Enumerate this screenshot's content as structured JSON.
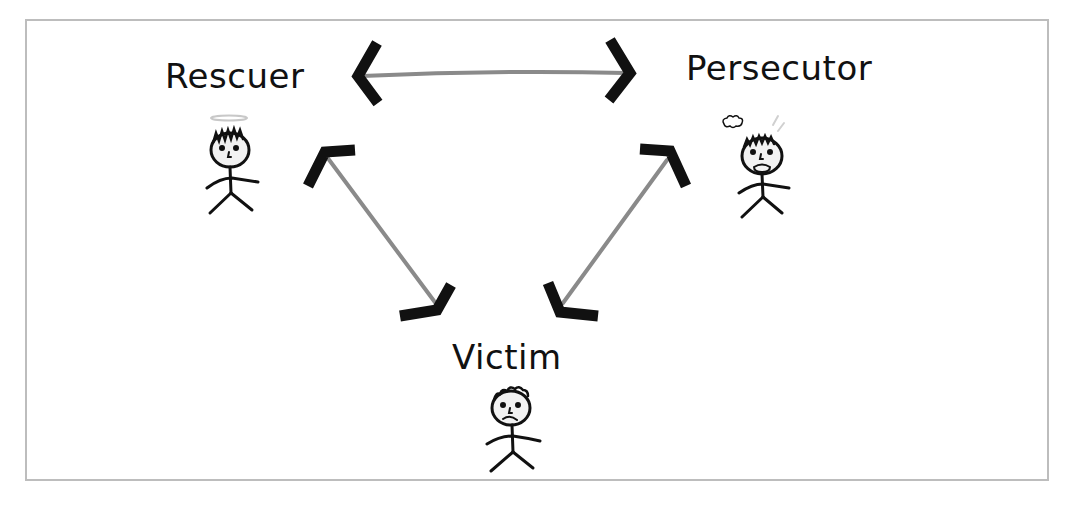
{
  "diagram": {
    "roles": [
      {
        "id": "rescuer",
        "label": "Rescuer",
        "emotion": "calm-halo"
      },
      {
        "id": "persecutor",
        "label": "Persecutor",
        "emotion": "angry-steam"
      },
      {
        "id": "victim",
        "label": "Victim",
        "emotion": "sad"
      }
    ],
    "connections": [
      {
        "from": "rescuer",
        "to": "persecutor",
        "type": "bidirectional-arrow"
      },
      {
        "from": "rescuer",
        "to": "victim",
        "type": "bidirectional-arrow"
      },
      {
        "from": "persecutor",
        "to": "victim",
        "type": "bidirectional-arrow"
      }
    ],
    "colors": {
      "arrow_shaft": "#8a8a8a",
      "arrow_head": "#111111",
      "frame_border": "#bdbdbd",
      "figure_line": "#111111",
      "face_fill": "#f2f2f2"
    }
  }
}
